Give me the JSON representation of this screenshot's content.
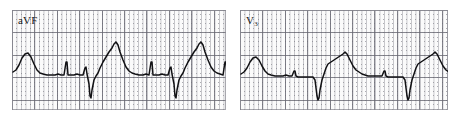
{
  "figure": {
    "type": "ecg-strip-pair",
    "background_color": "#ffffff",
    "paper_color": "#fbfbfb",
    "trace_color": "#111114",
    "grid_major_color": "#696973",
    "grid_minor_color": "#787882"
  },
  "panels": [
    {
      "id": "avf",
      "lead_label": "aVF",
      "lead_label_main": "aVF",
      "lead_label_sub": "",
      "x": 12,
      "y": 10,
      "width": 214,
      "height": 100,
      "grid_major_px": 22.4,
      "grid_minor_px": 4.48,
      "baseline_y": 64,
      "beats": 4,
      "description": "aVF lead: upright P waves, small R, deep wide QS complexes, tall peaked T waves"
    },
    {
      "id": "v3",
      "lead_label": "V3",
      "lead_label_main": "V",
      "lead_label_sub": "3",
      "x": 240,
      "y": 10,
      "width": 208,
      "height": 100,
      "grid_major_px": 22.4,
      "grid_minor_px": 4.48,
      "baseline_y": 64,
      "beats": 3,
      "description": "V3 lead: low amplitude P, narrow deep QS, asymmetric peaked T waves"
    }
  ],
  "chart_data": {
    "type": "line",
    "title": "",
    "xlabel": "",
    "ylabel": "",
    "grid": true,
    "legend_position": "inside-top-left",
    "series": [
      {
        "name": "aVF",
        "points": "1,62 4,60 7,55 10,48 13,44 16,43 19,47 22,54 25,60 28,63 31,64 35,65 39,65 43,65 46,64 49,65 52,65 54,52 55,52 56,65 58,65 62,65 65,64 68,65 71,65 73,58 74,57 75,64 77,74 78,86 79,88 80,80 82,70 84,66 86,63 88,58 91,52 94,47 97,42 100,38 102,34 104,32 106,35 108,42 111,50 114,57 117,61 120,63 123,64 127,65 131,65 134,64 137,65 139,52 140,52 141,65 143,65 147,65 150,64 153,65 156,65 158,58 159,57 160,64 162,74 163,86 164,88 165,80 167,70 169,66 171,63 173,58 176,52 179,47 182,42 185,38 187,34 189,32 191,35 193,42 196,50 199,57 202,61 205,63 208,64 211,65 213,52 214,52 215,65 217,65 219,64 221,58 222,57 223,64 224,74 225,84"
      },
      {
        "name": "V3",
        "points": "1,64 4,62 7,58 10,52 13,48 16,47 19,50 22,56 25,61 28,64 31,65 35,66 39,66 43,66 46,65 49,66 52,66 54,61 55,61 56,66 58,67 62,67 66,67 70,67 73,67 75,70 76,78 77,86 78,90 79,88 80,80 82,70 84,64 86,58 88,54 91,52 94,50 97,48 100,46 103,44 105,42 107,44 110,50 113,56 116,60 119,62 122,64 125,65 128,66 132,66 136,66 139,66 142,66 144,61 145,61 146,66 148,67 152,67 156,67 160,67 163,67 165,70 166,78 167,86 168,90 169,88 170,80 172,70 174,64 176,58 178,54 181,52 184,50 187,48 190,46 193,44 195,42 197,44 200,50 203,56 206,60 209,62 212,64 215,65 218,66 222,66 226,66 230,66 234,66 237,66 239,62 240,62 241,66 243,67 247,67 251,67 255,67 258,67"
      }
    ]
  }
}
